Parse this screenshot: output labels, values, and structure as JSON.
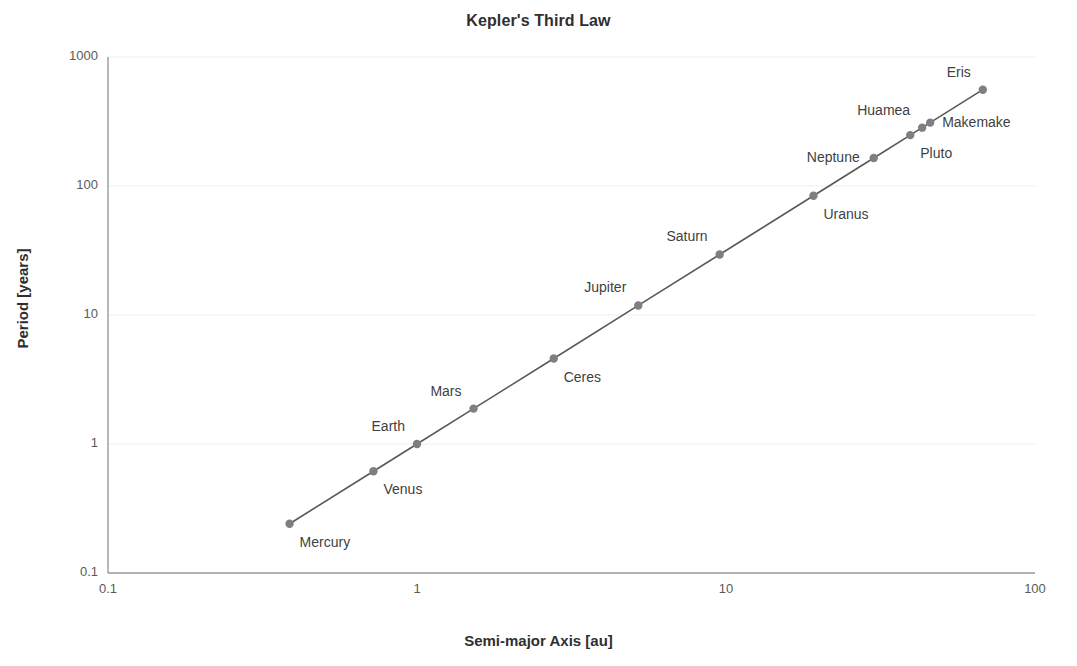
{
  "chart_data": {
    "type": "scatter",
    "title": "Kepler's Third Law",
    "xlabel": "Semi-major Axis [au]",
    "ylabel": "Period [years]",
    "xscale": "log",
    "yscale": "log",
    "xlim": [
      0.1,
      100
    ],
    "ylim": [
      0.1,
      1000
    ],
    "xticks": [
      "0.1",
      "1",
      "10",
      "100"
    ],
    "yticks": [
      "0.1",
      "1",
      "10",
      "100",
      "1000"
    ],
    "grid": true,
    "legend": "none",
    "line_connects_points": true,
    "series_color": "#808080",
    "marker_color": "#7f7f7f",
    "line_color": "#595959",
    "grid_color": "#efefef",
    "axis_color": "#9a9a9a",
    "points": [
      {
        "name": "Mercury",
        "x": 0.387,
        "y": 0.241,
        "label_pos": "below-right"
      },
      {
        "name": "Venus",
        "x": 0.723,
        "y": 0.615,
        "label_pos": "below-right"
      },
      {
        "name": "Earth",
        "x": 1.0,
        "y": 1.0,
        "label_pos": "above-left"
      },
      {
        "name": "Mars",
        "x": 1.524,
        "y": 1.881,
        "label_pos": "above-left"
      },
      {
        "name": "Ceres",
        "x": 2.77,
        "y": 4.6,
        "label_pos": "below-right"
      },
      {
        "name": "Jupiter",
        "x": 5.203,
        "y": 11.86,
        "label_pos": "above-left"
      },
      {
        "name": "Saturn",
        "x": 9.537,
        "y": 29.45,
        "label_pos": "above-left"
      },
      {
        "name": "Uranus",
        "x": 19.19,
        "y": 84.02,
        "label_pos": "below-right"
      },
      {
        "name": "Neptune",
        "x": 30.07,
        "y": 164.8,
        "label_pos": "left"
      },
      {
        "name": "Huamea",
        "x": 43.13,
        "y": 283.3,
        "label_pos": "above-left"
      },
      {
        "name": "Pluto",
        "x": 39.48,
        "y": 248.0,
        "label_pos": "below-right"
      },
      {
        "name": "Makemake",
        "x": 45.79,
        "y": 309.9,
        "label_pos": "right"
      },
      {
        "name": "Eris",
        "x": 67.78,
        "y": 558.0,
        "label_pos": "above-left"
      }
    ]
  }
}
